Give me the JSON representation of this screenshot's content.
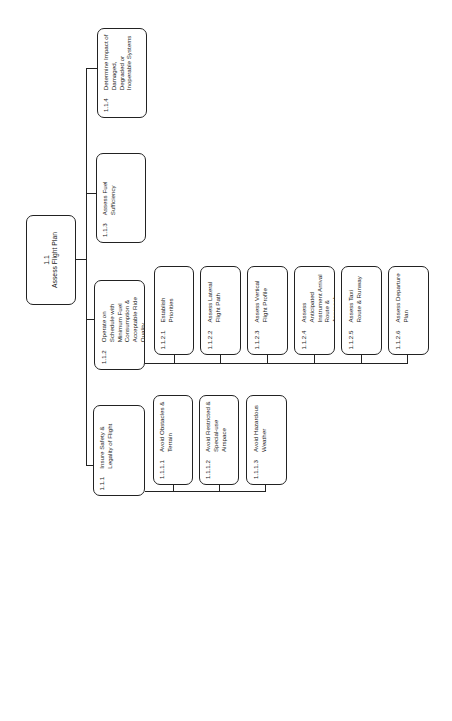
{
  "diagram": {
    "orientation": "rotated-90-ccw",
    "root": {
      "id": "1.1",
      "label": "Assess Flight Plan"
    },
    "level1": [
      {
        "id": "1.1.1",
        "label": "Insure Safety & Legality of Flight",
        "children": [
          {
            "id": "1.1.1.1",
            "label": "Avoid Obstacles & Terrain"
          },
          {
            "id": "1.1.1.2",
            "label": "Avoid Restricted & Special-use Airspace"
          },
          {
            "id": "1.1.1.3",
            "label": "Avoid Hazardous Weather"
          }
        ]
      },
      {
        "id": "1.1.2",
        "label": "Operate on Schedule with Minimum Fuel Consumption & Acceptable Ride Quality",
        "children": [
          {
            "id": "1.1.2.1",
            "label": "Establish Priorities"
          },
          {
            "id": "1.1.2.2",
            "label": "Assess Lateral Flight Path"
          },
          {
            "id": "1.1.2.3",
            "label": "Assess Vertical Flight Profile"
          },
          {
            "id": "1.1.2.4",
            "label": "Assess Anticipated Instrument Arrival Route & Approach"
          },
          {
            "id": "1.1.2.5",
            "label": "Assess Taxi Route & Runway"
          },
          {
            "id": "1.1.2.6",
            "label": "Assess Departure Plan"
          }
        ]
      },
      {
        "id": "1.1.3",
        "label": "Assess Fuel Sufficiency",
        "children": []
      },
      {
        "id": "1.1.4",
        "label": "Determine Impact of Damaged, Degraded or Inoperable Systems",
        "children": []
      }
    ]
  }
}
